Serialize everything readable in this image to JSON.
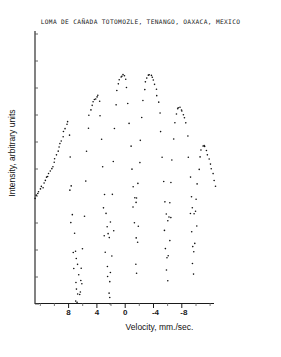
{
  "chart_data": {
    "type": "scatter",
    "title": "LOMA DE CAÑADA TOTOMOZLE, TENANGO, OAXACA, MEXICO",
    "xlabel": "Velocity, mm./sec.",
    "ylabel": "Intensity, arbitrary units",
    "xlim": [
      10.0,
      -10.0
    ],
    "ylim": [
      0.0,
      1.0
    ],
    "x_axis_inverted": true,
    "grid": false,
    "legend": null,
    "xticks": [
      8,
      4,
      0,
      -4,
      -8
    ],
    "xtick_labels": [
      "8",
      "4",
      "0",
      "-4",
      "-8"
    ],
    "xminor_tick_step": 2,
    "yticks_unlabeled_count": 10,
    "marker": "dot",
    "marker_size_px": 1.6,
    "series": [
      {
        "name": "Mossbauer transmission spectrum",
        "description": "Parabolic baseline with six-line magnetic hyperfine absorption pattern",
        "points": [
          [
            10.0,
            0.388
          ],
          [
            9.86,
            0.398
          ],
          [
            9.72,
            0.404
          ],
          [
            9.58,
            0.411
          ],
          [
            9.44,
            0.42
          ],
          [
            9.3,
            0.433
          ],
          [
            9.16,
            0.428
          ],
          [
            9.02,
            0.445
          ],
          [
            8.88,
            0.452
          ],
          [
            8.74,
            0.462
          ],
          [
            8.6,
            0.47
          ],
          [
            8.46,
            0.478
          ],
          [
            8.32,
            0.488
          ],
          [
            8.18,
            0.497
          ],
          [
            8.04,
            0.506
          ],
          [
            7.9,
            0.516
          ],
          [
            7.76,
            0.53
          ],
          [
            7.62,
            0.546
          ],
          [
            7.48,
            0.56
          ],
          [
            7.34,
            0.572
          ],
          [
            7.2,
            0.585
          ],
          [
            7.06,
            0.598
          ],
          [
            6.92,
            0.612
          ],
          [
            6.78,
            0.628
          ],
          [
            6.64,
            0.641
          ],
          [
            6.5,
            0.657
          ],
          [
            6.36,
            0.664
          ],
          [
            6.22,
            0.62
          ],
          [
            6.08,
            0.54
          ],
          [
            5.94,
            0.43
          ],
          [
            5.8,
            0.33
          ],
          [
            5.66,
            0.258
          ],
          [
            5.52,
            0.196
          ],
          [
            5.38,
            0.168
          ],
          [
            5.24,
            0.15
          ],
          [
            5.1,
            0.112
          ],
          [
            4.96,
            0.088
          ],
          [
            4.82,
            0.132
          ],
          [
            4.68,
            0.205
          ],
          [
            4.54,
            0.32
          ],
          [
            4.4,
            0.452
          ],
          [
            4.26,
            0.56
          ],
          [
            4.12,
            0.64
          ],
          [
            3.98,
            0.69
          ],
          [
            3.84,
            0.712
          ],
          [
            3.7,
            0.726
          ],
          [
            3.56,
            0.738
          ],
          [
            3.42,
            0.745
          ],
          [
            3.28,
            0.752
          ],
          [
            3.14,
            0.757
          ],
          [
            3.0,
            0.76
          ],
          [
            2.86,
            0.742
          ],
          [
            2.72,
            0.69
          ],
          [
            2.58,
            0.605
          ],
          [
            2.44,
            0.5
          ],
          [
            2.3,
            0.404
          ],
          [
            2.16,
            0.33
          ],
          [
            2.02,
            0.286
          ],
          [
            1.88,
            0.262
          ],
          [
            1.74,
            0.248
          ],
          [
            1.6,
            0.3
          ],
          [
            1.46,
            0.4
          ],
          [
            1.32,
            0.52
          ],
          [
            1.18,
            0.64
          ],
          [
            1.04,
            0.728
          ],
          [
            0.9,
            0.78
          ],
          [
            0.76,
            0.806
          ],
          [
            0.62,
            0.82
          ],
          [
            0.48,
            0.828
          ],
          [
            0.34,
            0.834
          ],
          [
            0.2,
            0.836
          ],
          [
            0.06,
            0.832
          ],
          [
            -0.08,
            0.82
          ],
          [
            -0.22,
            0.79
          ],
          [
            -0.36,
            0.735
          ],
          [
            -0.5,
            0.66
          ],
          [
            -0.64,
            0.575
          ],
          [
            -0.78,
            0.495
          ],
          [
            -0.92,
            0.432
          ],
          [
            -1.06,
            0.392
          ],
          [
            -1.2,
            0.375
          ],
          [
            -1.34,
            0.392
          ],
          [
            -1.48,
            0.44
          ],
          [
            -1.62,
            0.515
          ],
          [
            -1.76,
            0.6
          ],
          [
            -1.9,
            0.68
          ],
          [
            -2.04,
            0.742
          ],
          [
            -2.18,
            0.785
          ],
          [
            -2.32,
            0.812
          ],
          [
            -2.46,
            0.828
          ],
          [
            -2.6,
            0.838
          ],
          [
            -2.74,
            0.84
          ],
          [
            -2.88,
            0.836
          ],
          [
            -3.02,
            0.828
          ],
          [
            -3.16,
            0.816
          ],
          [
            -3.3,
            0.8
          ],
          [
            -3.44,
            0.782
          ],
          [
            -3.58,
            0.762
          ],
          [
            -3.72,
            0.74
          ],
          [
            -3.86,
            0.7
          ],
          [
            -4.0,
            0.63
          ],
          [
            -4.14,
            0.54
          ],
          [
            -4.28,
            0.45
          ],
          [
            -4.42,
            0.378
          ],
          [
            -4.56,
            0.33
          ],
          [
            -4.7,
            0.308
          ],
          [
            -4.84,
            0.32
          ],
          [
            -4.98,
            0.37
          ],
          [
            -5.12,
            0.446
          ],
          [
            -5.26,
            0.53
          ],
          [
            -5.4,
            0.604
          ],
          [
            -5.54,
            0.66
          ],
          [
            -5.68,
            0.694
          ],
          [
            -5.82,
            0.712
          ],
          [
            -5.96,
            0.72
          ],
          [
            -6.1,
            0.718
          ],
          [
            -6.24,
            0.712
          ],
          [
            -6.38,
            0.704
          ],
          [
            -6.52,
            0.694
          ],
          [
            -6.66,
            0.684
          ],
          [
            -6.8,
            0.66
          ],
          [
            -6.94,
            0.612
          ],
          [
            -7.08,
            0.54
          ],
          [
            -7.22,
            0.462
          ],
          [
            -7.36,
            0.396
          ],
          [
            -7.5,
            0.352
          ],
          [
            -7.64,
            0.33
          ],
          [
            -7.78,
            0.342
          ],
          [
            -7.92,
            0.382
          ],
          [
            -8.06,
            0.44
          ],
          [
            -8.2,
            0.496
          ],
          [
            -8.34,
            0.54
          ],
          [
            -8.48,
            0.566
          ],
          [
            -8.62,
            0.578
          ],
          [
            -8.76,
            0.58
          ],
          [
            -8.9,
            0.574
          ],
          [
            -9.04,
            0.562
          ],
          [
            -9.18,
            0.548
          ],
          [
            -9.32,
            0.532
          ],
          [
            -9.46,
            0.514
          ],
          [
            -9.6,
            0.496
          ],
          [
            -9.74,
            0.476
          ],
          [
            -9.88,
            0.452
          ],
          [
            -10.0,
            0.43
          ]
        ],
        "deep_absorption_points": [
          [
            5.8,
            0.19
          ],
          [
            5.66,
            0.13
          ],
          [
            5.52,
            0.082
          ],
          [
            5.38,
            0.055
          ],
          [
            5.24,
            0.04
          ],
          [
            5.1,
            0.035
          ],
          [
            4.96,
            0.048
          ],
          [
            4.82,
            0.074
          ],
          [
            6.05,
            0.3
          ],
          [
            6.18,
            0.42
          ],
          [
            2.3,
            0.252
          ],
          [
            2.16,
            0.19
          ],
          [
            2.02,
            0.14
          ],
          [
            1.88,
            0.104
          ],
          [
            1.74,
            0.088
          ],
          [
            1.6,
            0.116
          ],
          [
            1.46,
            0.178
          ],
          [
            1.32,
            0.268
          ],
          [
            2.44,
            0.35
          ],
          [
            -1.06,
            0.3
          ],
          [
            -1.2,
            0.244
          ],
          [
            -1.34,
            0.232
          ],
          [
            -1.48,
            0.29
          ],
          [
            -0.92,
            0.36
          ],
          [
            -4.42,
            0.272
          ],
          [
            -4.56,
            0.208
          ],
          [
            -4.7,
            0.17
          ],
          [
            -4.84,
            0.18
          ],
          [
            -4.98,
            0.238
          ],
          [
            -5.12,
            0.32
          ],
          [
            -7.22,
            0.336
          ],
          [
            -7.36,
            0.268
          ],
          [
            -7.5,
            0.216
          ],
          [
            -7.64,
            0.196
          ],
          [
            -7.78,
            0.224
          ],
          [
            -7.92,
            0.29
          ]
        ],
        "noise_tail_points": [
          [
            5.45,
            0.015
          ],
          [
            5.32,
            0.006
          ],
          [
            1.82,
            0.046
          ],
          [
            1.68,
            0.028
          ],
          [
            1.7,
            0.008
          ],
          [
            -1.24,
            0.152
          ],
          [
            -1.3,
            0.118
          ],
          [
            -4.66,
            0.124
          ],
          [
            -4.72,
            0.09
          ],
          [
            -7.55,
            0.15
          ],
          [
            -7.6,
            0.112
          ]
        ],
        "absorption_lines_velocity": [
          5.2,
          1.8,
          -1.2,
          -4.7,
          -7.6
        ],
        "baseline_peak_velocity": 0.2
      }
    ]
  }
}
